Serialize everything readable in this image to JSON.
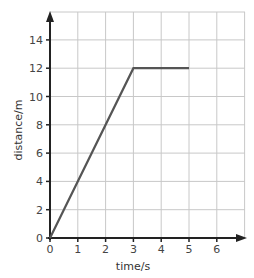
{
  "chart_data": {
    "type": "line",
    "title": "",
    "xlabel": "time/s",
    "ylabel": "distance/m",
    "xlim": [
      0,
      7
    ],
    "ylim": [
      0,
      15
    ],
    "x_ticks": [
      0,
      1,
      2,
      3,
      4,
      5,
      6
    ],
    "y_ticks": [
      0,
      2,
      4,
      6,
      8,
      10,
      12,
      14
    ],
    "x_tick_labels": [
      "0",
      "1",
      "2",
      "3",
      "4",
      "5",
      "6"
    ],
    "y_tick_labels": [
      "0",
      "2",
      "4",
      "6",
      "8",
      "10",
      "12",
      "14"
    ],
    "grid": true,
    "legend": null,
    "series": [
      {
        "name": "distance",
        "x": [
          0,
          3,
          5
        ],
        "y": [
          0,
          12,
          12
        ],
        "color": "#555555"
      }
    ]
  },
  "colors": {
    "grid": "#c8c8c8",
    "axis": "#222222",
    "line": "#555555"
  }
}
